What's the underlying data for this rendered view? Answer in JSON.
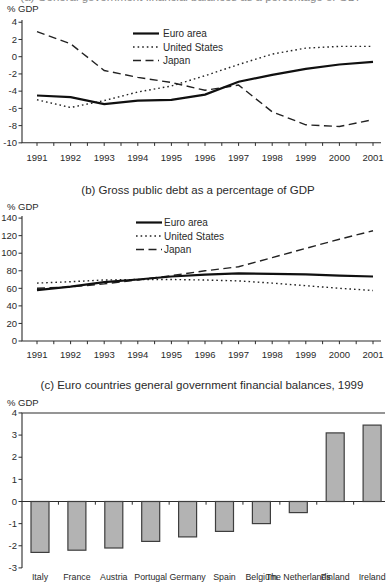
{
  "page": {
    "background": "#ffffff",
    "text_color": "#2a2a2a"
  },
  "panel_a_clipped_title": "(a) General government financial balances as a percentage of GDP",
  "chart_data": [
    {
      "id": "panel-a",
      "type": "line",
      "title": "",
      "ylabel": "% GDP",
      "x": [
        1991,
        1992,
        1993,
        1994,
        1995,
        1996,
        1997,
        1998,
        1999,
        2000,
        2001
      ],
      "ylim": [
        -10,
        4
      ],
      "y_ticks": [
        4,
        2,
        0,
        -2,
        -4,
        -6,
        -8,
        -10
      ],
      "grid": false,
      "legend_position": "top-center",
      "series": [
        {
          "name": "Euro area",
          "style": "solid",
          "values": [
            -4.5,
            -4.7,
            -5.5,
            -5.1,
            -5.0,
            -4.4,
            -2.9,
            -2.1,
            -1.4,
            -0.9,
            -0.6
          ]
        },
        {
          "name": "United States",
          "style": "dotted",
          "values": [
            -5.0,
            -5.9,
            -5.1,
            -4.1,
            -3.4,
            -2.2,
            -0.9,
            0.3,
            1.0,
            1.2,
            1.2
          ]
        },
        {
          "name": "Japan",
          "style": "dashed",
          "values": [
            2.9,
            1.5,
            -1.6,
            -2.4,
            -3.0,
            -3.9,
            -3.3,
            -6.4,
            -7.9,
            -8.1,
            -7.3
          ]
        }
      ]
    },
    {
      "id": "panel-b",
      "type": "line",
      "title": "(b) Gross public debt as a percentage of GDP",
      "ylabel": "% GDP",
      "x": [
        1991,
        1992,
        1993,
        1994,
        1995,
        1996,
        1997,
        1998,
        1999,
        2000,
        2001
      ],
      "ylim": [
        0,
        140
      ],
      "y_ticks": [
        140,
        120,
        100,
        80,
        60,
        40,
        20,
        0
      ],
      "grid": false,
      "legend_position": "top-center",
      "series": [
        {
          "name": "Euro area",
          "style": "solid",
          "values": [
            58,
            62,
            67,
            70,
            73.5,
            75.5,
            77,
            76.5,
            76,
            74.5,
            73.5
          ]
        },
        {
          "name": "United States",
          "style": "dotted",
          "values": [
            66,
            67.5,
            69.5,
            70,
            70,
            69.5,
            68.5,
            66,
            63,
            60,
            57.5
          ]
        },
        {
          "name": "Japan",
          "style": "dashed",
          "values": [
            60,
            61.5,
            65,
            69.5,
            74.5,
            80,
            84.5,
            95,
            105.5,
            116,
            125.5
          ]
        }
      ]
    },
    {
      "id": "panel-c",
      "type": "bar",
      "title": "(c) Euro countries general government financial balances, 1999",
      "ylabel": "% GDP",
      "categories": [
        "Italy",
        "France",
        "Austria",
        "Portugal",
        "Germany",
        "Spain",
        "Belgium",
        "The Netherlands",
        "Finland",
        "Ireland"
      ],
      "values": [
        -2.3,
        -2.2,
        -2.1,
        -1.8,
        -1.6,
        -1.35,
        -1.0,
        -0.5,
        3.1,
        3.45
      ],
      "ylim": [
        -3,
        4
      ],
      "y_ticks": [
        4,
        3,
        2,
        1,
        0,
        -1,
        -2,
        -3
      ],
      "grid": false,
      "bar_color": "#b3b3b3",
      "bar_border": "#3e3e3e"
    }
  ]
}
